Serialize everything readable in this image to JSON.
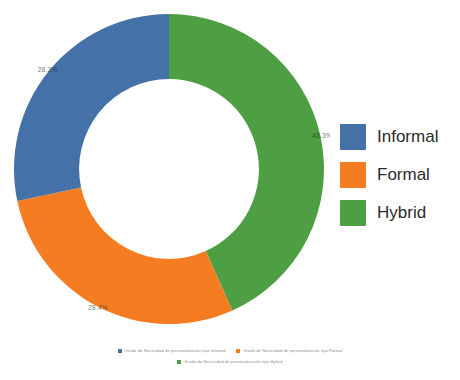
{
  "chart_data": {
    "type": "pie",
    "variant": "donut",
    "title": "",
    "xlabel": "",
    "ylabel": "",
    "legend_position": "right",
    "grid": false,
    "start_angle_deg": 0,
    "direction": "clockwise",
    "inner_radius_ratio": 0.58,
    "categories": [
      "Informal",
      "Formal",
      "Hybrid"
    ],
    "values": [
      28.3,
      28.4,
      43.3
    ],
    "value_labels": [
      "28.3%",
      "28.4%",
      "43.3%"
    ],
    "colors": [
      "#4472a8",
      "#f57c20",
      "#4e9f43"
    ],
    "series": [
      {
        "name": "Grado de necesidad de personalización",
        "values": [
          28.3,
          28.4,
          43.3
        ]
      }
    ]
  },
  "legend": {
    "items": [
      {
        "label": "Informal",
        "color": "#4472a8"
      },
      {
        "label": "Formal",
        "color": "#f57c20"
      },
      {
        "label": "Hybrid",
        "color": "#4e9f43"
      }
    ]
  },
  "caption": {
    "line1": [
      {
        "text": "Grado de Necesidad de personalización tipo Informal",
        "color": "#4472a8"
      },
      {
        "text": "Grado de Necesidad de personalización tipo Formal",
        "color": "#f57c20"
      }
    ],
    "line2": [
      {
        "text": "Grado de Necesidad de personalización tipo Hybrid",
        "color": "#4e9f43"
      }
    ]
  }
}
